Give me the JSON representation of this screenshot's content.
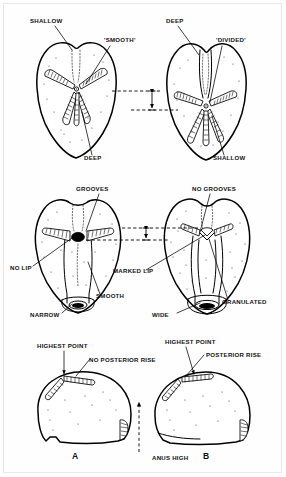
{
  "figure": {
    "border_color": "#e8e8e8",
    "ink_color": "#000000",
    "background": "#ffffff"
  },
  "rows": [
    {
      "id": "row-aboral",
      "view": "aboral (upper) surface",
      "specimens": [
        {
          "id": "aboral-left",
          "side": "left",
          "labels": [
            {
              "key": "shallow_top",
              "text": "SHALLOW",
              "x": 30,
              "y": 23,
              "anchor": "start"
            },
            {
              "key": "smooth",
              "text": "'SMOOTH'",
              "x": 104,
              "y": 42,
              "anchor": "start"
            },
            {
              "key": "deep_bottom",
              "text": "DEEP",
              "x": 84,
              "y": 160,
              "anchor": "start"
            }
          ]
        },
        {
          "id": "aboral-right",
          "side": "right",
          "labels": [
            {
              "key": "deep_top",
              "text": "DEEP",
              "x": 166,
              "y": 23,
              "anchor": "start"
            },
            {
              "key": "divided",
              "text": "'DIVIDED'",
              "x": 216,
              "y": 42,
              "anchor": "start"
            },
            {
              "key": "shallow_bottom",
              "text": "SHALLOW",
              "x": 213,
              "y": 160,
              "anchor": "start"
            }
          ]
        }
      ]
    },
    {
      "id": "row-oral",
      "view": "oral (lower) surface",
      "specimens": [
        {
          "id": "oral-left",
          "side": "left",
          "labels": [
            {
              "key": "grooves",
              "text": "GROOVES",
              "x": 76,
              "y": 191,
              "anchor": "start"
            },
            {
              "key": "no_lip",
              "text": "NO LIP",
              "x": 10,
              "y": 270,
              "anchor": "start"
            },
            {
              "key": "narrow",
              "text": "NARROW",
              "x": 30,
              "y": 317,
              "anchor": "start"
            },
            {
              "key": "smooth",
              "text": "SMOOTH",
              "x": 96,
              "y": 298,
              "anchor": "start"
            }
          ]
        },
        {
          "id": "oral-right",
          "side": "right",
          "labels": [
            {
              "key": "no_grooves",
              "text": "NO GROOVES",
              "x": 192,
              "y": 191,
              "anchor": "start"
            },
            {
              "key": "marked_lip",
              "text": "MARKED LIP",
              "x": 113,
              "y": 273,
              "anchor": "start"
            },
            {
              "key": "wide",
              "text": "WIDE",
              "x": 152,
              "y": 317,
              "anchor": "start"
            },
            {
              "key": "granulated",
              "text": "GRANULATED",
              "x": 222,
              "y": 304,
              "anchor": "start"
            }
          ]
        }
      ]
    },
    {
      "id": "row-lateral",
      "view": "lateral profile",
      "specimens": [
        {
          "id": "lateral-a",
          "side": "left",
          "panel_letter": "A",
          "panel_letter_x": 75,
          "panel_letter_y": 459,
          "labels": [
            {
              "key": "highest_point",
              "text": "HIGHEST POINT",
              "x": 37,
              "y": 348,
              "anchor": "start"
            },
            {
              "key": "no_posterior_rise",
              "text": "NO POSTERIOR RISE",
              "x": 89,
              "y": 362,
              "anchor": "start"
            },
            {
              "key": "anus_high",
              "text": "ANUS HIGH",
              "x": 152,
              "y": 460,
              "anchor": "start"
            }
          ]
        },
        {
          "id": "lateral-b",
          "side": "right",
          "panel_letter": "B",
          "panel_letter_x": 206,
          "panel_letter_y": 459,
          "labels": [
            {
              "key": "highest_point",
              "text": "HIGHEST POINT",
              "x": 165,
              "y": 344,
              "anchor": "start"
            },
            {
              "key": "posterior_rise",
              "text": "POSTERIOR RISE",
              "x": 206,
              "y": 357,
              "anchor": "start"
            }
          ]
        }
      ]
    }
  ],
  "annotations": {
    "height_brackets": [
      {
        "key": "bracket-aboral",
        "note": "double-headed arrow between dashed alignment lines, upper row"
      },
      {
        "key": "bracket-oral",
        "note": "double-headed arrow between dashed alignment lines, middle row"
      }
    ],
    "dashed_alignment_lines": 4,
    "anus_arrow": "upward dashed arrow to anus position on specimen A"
  }
}
